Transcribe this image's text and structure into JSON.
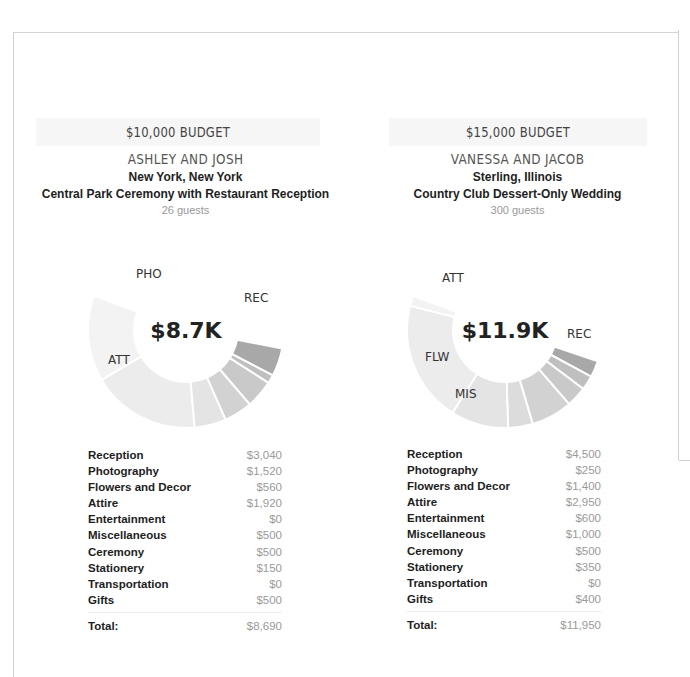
{
  "cards": [
    {
      "budget_label": "$10,000 BUDGET",
      "couple": "ASHLEY AND JOSH",
      "location": "New York, New York",
      "description": "Central Park Ceremony with Restaurant Reception",
      "guests": "26 guests",
      "center_total": "$8.7K",
      "chart_labels": {
        "REC": "REC",
        "PHO": "PHO",
        "ATT": "ATT"
      },
      "items": [
        {
          "label": "Reception",
          "value": "$3,040"
        },
        {
          "label": "Photography",
          "value": "$1,520"
        },
        {
          "label": "Flowers and Decor",
          "value": "$560"
        },
        {
          "label": "Attire",
          "value": "$1,920"
        },
        {
          "label": "Entertainment",
          "value": "$0"
        },
        {
          "label": "Miscellaneous",
          "value": "$500"
        },
        {
          "label": "Ceremony",
          "value": "$500"
        },
        {
          "label": "Stationery",
          "value": "$150"
        },
        {
          "label": "Transportation",
          "value": "$0"
        },
        {
          "label": "Gifts",
          "value": "$500"
        }
      ],
      "total_label": "Total:",
      "total_value": "$8,690"
    },
    {
      "budget_label": "$15,000 BUDGET",
      "couple": "VANESSA AND JACOB",
      "location": "Sterling, Illinois",
      "description": "Country Club Dessert-Only Wedding",
      "guests": "300 guests",
      "center_total": "$11.9K",
      "chart_labels": {
        "REC": "REC",
        "ATT": "ATT",
        "FLW": "FLW",
        "MIS": "MIS"
      },
      "items": [
        {
          "label": "Reception",
          "value": "$4,500"
        },
        {
          "label": "Photography",
          "value": "$250"
        },
        {
          "label": "Flowers and Decor",
          "value": "$1,400"
        },
        {
          "label": "Attire",
          "value": "$2,950"
        },
        {
          "label": "Entertainment",
          "value": "$600"
        },
        {
          "label": "Miscellaneous",
          "value": "$1,000"
        },
        {
          "label": "Ceremony",
          "value": "$500"
        },
        {
          "label": "Stationery",
          "value": "$350"
        },
        {
          "label": "Transportation",
          "value": "$0"
        },
        {
          "label": "Gifts",
          "value": "$400"
        }
      ],
      "total_label": "Total:",
      "total_value": "$11,950"
    }
  ],
  "chart_data": [
    {
      "type": "pie",
      "title": "$10,000 BUDGET - Ashley and Josh",
      "center_label": "$8.7K",
      "categories": [
        "Reception",
        "Photography",
        "Flowers and Decor",
        "Attire",
        "Entertainment",
        "Miscellaneous",
        "Ceremony",
        "Stationery",
        "Transportation",
        "Gifts"
      ],
      "abbreviations": [
        "REC",
        "PHO",
        "FLW",
        "ATT",
        "ENT",
        "MIS",
        "CER",
        "STA",
        "TRA",
        "GIF"
      ],
      "values": [
        3040,
        1520,
        560,
        1920,
        0,
        500,
        500,
        150,
        0,
        500
      ],
      "total": 8690
    },
    {
      "type": "pie",
      "title": "$15,000 BUDGET - Vanessa and Jacob",
      "center_label": "$11.9K",
      "categories": [
        "Reception",
        "Photography",
        "Flowers and Decor",
        "Attire",
        "Entertainment",
        "Miscellaneous",
        "Ceremony",
        "Stationery",
        "Transportation",
        "Gifts"
      ],
      "abbreviations": [
        "REC",
        "PHO",
        "FLW",
        "ATT",
        "ENT",
        "MIS",
        "CER",
        "STA",
        "TRA",
        "GIF"
      ],
      "values": [
        4500,
        250,
        1400,
        2950,
        600,
        1000,
        500,
        350,
        0,
        400
      ],
      "total": 11950
    }
  ],
  "colors": {
    "segment_shades": [
      "#ffffff",
      "#f3f3f3",
      "#ececec",
      "#e4e4e4",
      "#dcdcdc",
      "#d2d2d2",
      "#c9c9c9",
      "#bfbfbf",
      "#b4b4b4",
      "#a8a8a8"
    ]
  }
}
